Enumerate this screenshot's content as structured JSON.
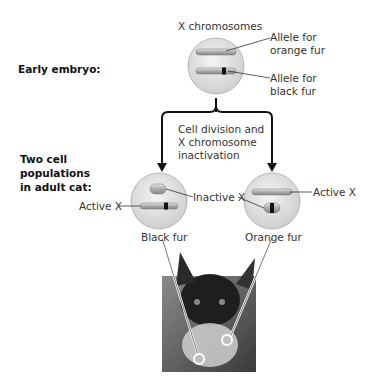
{
  "diagram": {
    "stage_labels": {
      "early": "Early embryo:",
      "adult": [
        "Two cell",
        "populations",
        "in adult cat:"
      ]
    },
    "top_cell": {
      "title": "X chromosomes",
      "allele_orange": [
        "Allele for",
        "orange fur"
      ],
      "allele_black": [
        "Allele for",
        "black fur"
      ]
    },
    "process_label": [
      "Cell division and",
      "X chromosome",
      "inactivation"
    ],
    "left_cell": {
      "active_label": "Active X",
      "result": "Black fur"
    },
    "shared_label": "Inactive X",
    "right_cell": {
      "active_label": "Active X",
      "result": "Orange fur"
    },
    "photo": "tortoiseshell-cat"
  }
}
